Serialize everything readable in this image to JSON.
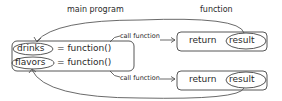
{
  "headings": {
    "main_program": "main program",
    "function": "function"
  },
  "main_program": {
    "lines": [
      {
        "variable": "drinks",
        "assign": "= function()"
      },
      {
        "variable": "flavors",
        "assign": "= function()"
      }
    ]
  },
  "arrows": {
    "call_top": "call function",
    "call_bottom": "call function"
  },
  "functions": [
    {
      "keyword": "return",
      "value": "result"
    },
    {
      "keyword": "return",
      "value": "result"
    }
  ]
}
